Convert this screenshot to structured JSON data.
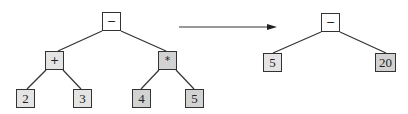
{
  "diagram": {
    "type": "expression-tree-simplification",
    "colors": {
      "edge": "#333333",
      "root_fill": "#ffffff",
      "plus_fill": "#e4e4e4",
      "times_fill": "#d2d2d2",
      "leaf_fill": "#e4e4e4"
    },
    "before": {
      "root": {
        "label": "−"
      },
      "left_op": {
        "label": "+"
      },
      "right_op": {
        "label": "*"
      },
      "leaves": [
        {
          "label": "2"
        },
        {
          "label": "3"
        },
        {
          "label": "4"
        },
        {
          "label": "5"
        }
      ]
    },
    "arrow": {
      "direction": "right"
    },
    "after": {
      "root": {
        "label": "−"
      },
      "leaves": [
        {
          "label": "5"
        },
        {
          "label": "20"
        }
      ]
    }
  }
}
